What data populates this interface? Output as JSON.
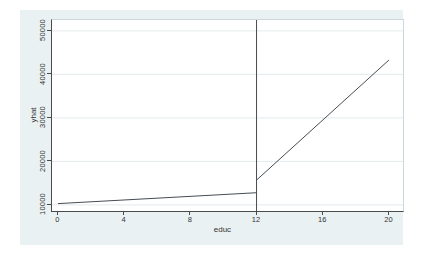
{
  "chart_data": {
    "type": "line",
    "title": "",
    "xlabel": "educ",
    "ylabel": "yhat",
    "xlim": [
      -0.36,
      20.85
    ],
    "ylim": [
      8600,
      52500
    ],
    "xticks": [
      0,
      4,
      8,
      12,
      16,
      20
    ],
    "yticks": [
      10000,
      20000,
      30000,
      40000,
      50000
    ],
    "grid": "horizontal",
    "legend": "none",
    "series": [
      {
        "name": "yhat-below-12",
        "points": [
          [
            0,
            10300
          ],
          [
            12,
            12800
          ]
        ]
      },
      {
        "name": "yhat-above-12",
        "points": [
          [
            12,
            15700
          ],
          [
            20,
            43300
          ]
        ]
      }
    ],
    "vline_x": 12,
    "colors": {
      "line": "#474c54",
      "axis": "#4a4a4a",
      "text": "#333333",
      "grid": "#e3eaec",
      "figure_bg": "#eaf1f2",
      "plot_bg": "#ffffff",
      "plot_border": "#ccd9dc"
    }
  }
}
